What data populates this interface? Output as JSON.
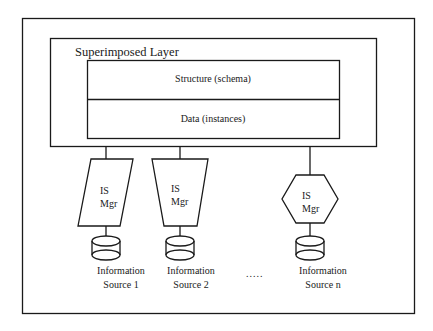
{
  "diagram": {
    "layer_title": "Superimposed Layer",
    "sections": [
      {
        "label": "Structure (schema)"
      },
      {
        "label": "Data (instances)"
      }
    ],
    "managers": [
      {
        "shape": "parallelogram",
        "line1": "IS",
        "line2": "Mgr"
      },
      {
        "shape": "trapezoid",
        "line1": "IS",
        "line2": "Mgr"
      },
      {
        "shape": "hexagon",
        "line1": "IS",
        "line2": "Mgr"
      }
    ],
    "sources": [
      {
        "line1": "Information",
        "line2": "Source 1",
        "icon": "database-cylinder-icon"
      },
      {
        "line1": "Information",
        "line2": "Source 2",
        "icon": "database-cylinder-icon"
      },
      {
        "line1": "Information",
        "line2": "Source n",
        "icon": "database-cylinder-icon"
      }
    ],
    "ellipsis": "....."
  },
  "colors": {
    "stroke": "#1a1a1a",
    "background": "#ffffff"
  }
}
